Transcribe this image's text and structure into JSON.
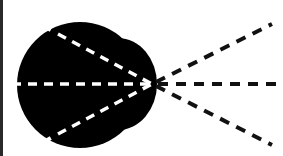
{
  "diagram": {
    "description": "Solid black lobe shape with three white dashed lines converging to a focal point, continuing as three black dashed lines diverging to the right",
    "colors": {
      "shape_fill": "#000000",
      "inner_dash": "#ffffff",
      "outer_dash": "#111111",
      "background": "#ffffff",
      "border": "#2a2a2a"
    },
    "focal_point": {
      "x": 152,
      "y": 84
    },
    "lines": [
      {
        "name": "upper",
        "inner_start": [
          48,
          28
        ],
        "outer_end": [
          272,
          24
        ]
      },
      {
        "name": "middle",
        "inner_start": [
          12,
          84
        ],
        "outer_end": [
          283,
          84
        ]
      },
      {
        "name": "lower",
        "inner_start": [
          48,
          140
        ],
        "outer_end": [
          272,
          145
        ]
      }
    ]
  }
}
